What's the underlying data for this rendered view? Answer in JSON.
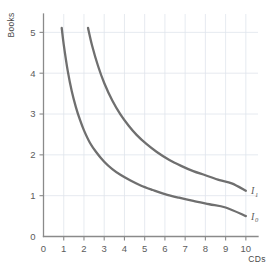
{
  "chart_data": {
    "type": "line",
    "title": "",
    "subtitle": "",
    "xlabel": "CDs",
    "ylabel": "Books",
    "xlim": [
      0,
      10.6
    ],
    "ylim": [
      0,
      5.45
    ],
    "xticks": [
      "0",
      "1",
      "2",
      "3",
      "4",
      "5",
      "6",
      "7",
      "8",
      "9",
      "10"
    ],
    "xtick_values": [
      0,
      1,
      2,
      3,
      4,
      5,
      6,
      7,
      8,
      9,
      10
    ],
    "yticks": [
      "0",
      "1",
      "2",
      "3",
      "4",
      "5"
    ],
    "ytick_values": [
      0,
      1,
      2,
      3,
      4,
      5
    ],
    "grid": true,
    "grid_color": "#dfe4ec",
    "axis_color": "#8a8a8a",
    "curve_color": "#6f6f6f",
    "legend_position": "inline-right",
    "annotations": [
      {
        "text": "I",
        "sub": "1",
        "x": 10.25,
        "y": 1.12
      },
      {
        "text": "I",
        "sub": "0",
        "x": 10.25,
        "y": 0.5
      }
    ],
    "series": [
      {
        "name": "I0",
        "label": "I",
        "label_sub": "0",
        "description": "lower indifference curve, xy = 4.6",
        "x": [
          0.9,
          1.0,
          1.2,
          1.4,
          1.6,
          1.8,
          2.0,
          2.3,
          2.6,
          3.0,
          3.4,
          3.8,
          4.3,
          4.8,
          5.4,
          6.0,
          6.7,
          7.4,
          8.2,
          9.0,
          10.0
        ],
        "y": [
          5.11,
          4.7,
          4.05,
          3.55,
          3.17,
          2.86,
          2.6,
          2.29,
          2.07,
          1.83,
          1.65,
          1.51,
          1.37,
          1.25,
          1.14,
          1.04,
          0.95,
          0.87,
          0.79,
          0.71,
          0.5
        ]
      },
      {
        "name": "I1",
        "label": "I",
        "label_sub": "1",
        "description": "upper indifference curve, xy = 11.2",
        "x": [
          2.2,
          2.4,
          2.7,
          3.0,
          3.4,
          3.8,
          4.2,
          4.6,
          5.1,
          5.6,
          6.2,
          6.8,
          7.4,
          8.0,
          8.7,
          9.3,
          10.0
        ],
        "y": [
          5.11,
          4.68,
          4.17,
          3.76,
          3.33,
          2.99,
          2.72,
          2.49,
          2.26,
          2.07,
          1.88,
          1.73,
          1.6,
          1.5,
          1.38,
          1.3,
          1.12
        ]
      }
    ]
  }
}
